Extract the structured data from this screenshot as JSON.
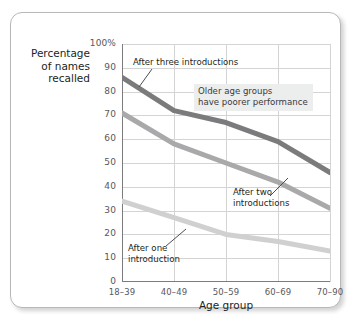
{
  "chart_data": {
    "type": "line",
    "title": "",
    "xlabel": "Age group",
    "ylabel": "Percentage of names recalled",
    "categories": [
      "18–39",
      "40–49",
      "50–59",
      "60–69",
      "70–90"
    ],
    "ylim": [
      0,
      100
    ],
    "y_ticks": [
      "0",
      "10",
      "20",
      "30",
      "40",
      "50",
      "60",
      "70",
      "80",
      "90",
      "100%"
    ],
    "y_tick_values": [
      0,
      10,
      20,
      30,
      40,
      50,
      60,
      70,
      80,
      90,
      100
    ],
    "grid": true,
    "legend_position": "none (inline callout labels)",
    "series": [
      {
        "name": "After three introductions",
        "color": "#7b7b7d",
        "values": [
          86,
          72,
          67,
          59,
          46
        ]
      },
      {
        "name": "After two introductions",
        "color": "#a9a9ab",
        "values": [
          71,
          58,
          50,
          42,
          31
        ]
      },
      {
        "name": "After one introduction",
        "color": "#d0d0d1",
        "values": [
          34,
          27,
          20,
          17,
          13
        ]
      }
    ],
    "annotations": [
      {
        "id": "annotation-three",
        "text": "After three introductions",
        "target_series": "After three introductions"
      },
      {
        "id": "annotation-two",
        "text": "After two\nintroductions",
        "target_series": "After two introductions"
      },
      {
        "id": "annotation-one",
        "text": "After one\nintroduction",
        "target_series": "After one introduction"
      },
      {
        "id": "annotation-note",
        "text": "Older age groups\nhave poorer performance",
        "target_series": ""
      }
    ]
  },
  "axis": {
    "y_title_line1": "Percentage",
    "y_title_line2": "of names",
    "y_title_line3": "recalled",
    "x_title": "Age group"
  },
  "colors": {
    "card_background": "#ffffff",
    "card_border": "#b8b8b8",
    "gridline": "#d4d4d4",
    "axis_line": "#7c7c7c",
    "tick_label": "#58585a",
    "note_background": "#eceded",
    "leader_line": "#4d4d4f"
  }
}
